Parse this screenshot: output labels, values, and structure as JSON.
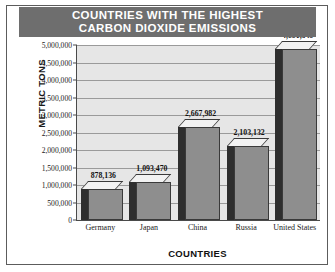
{
  "chart_data": {
    "type": "bar",
    "title": "COUNTRIES WITH THE HIGHEST CARBON DIOXIDE EMISSIONS",
    "title_line1": "COUNTRIES WITH THE HIGHEST",
    "title_line2": "CARBON DIOXIDE EMISSIONS",
    "xlabel": "COUNTRIES",
    "ylabel": "METRIC TONS",
    "categories": [
      "Germany",
      "Japan",
      "China",
      "Russia",
      "United States"
    ],
    "values": [
      878136,
      1093470,
      2667982,
      2103132,
      4881349
    ],
    "value_labels": [
      "878,136",
      "1,093,470",
      "2,667,982",
      "2,103,132",
      "4,881,349"
    ],
    "ylim": [
      0,
      5000000
    ],
    "ytick_values": [
      0,
      500000,
      1000000,
      1500000,
      2000000,
      2500000,
      3000000,
      3500000,
      4000000,
      4500000,
      5000000
    ],
    "ytick_labels": [
      "0",
      "500,000",
      "1,000,000",
      "1,500,000",
      "2,000,000",
      "2,500,000",
      "3,000,000",
      "3,500,000",
      "4,000,000",
      "4,500,000",
      "5,000,000"
    ],
    "grid": true,
    "legend": false,
    "style": "3d-bar",
    "colors": {
      "title_banner": "#6e6e6e",
      "title_text": "#ffffff",
      "plot_background": "#e6e6e6",
      "gridline": "#9a9a9a",
      "bar_face": "#8e8e8e",
      "bar_side": "#2e2e2e",
      "bar_top": "#f2f2f2",
      "bar_outline": "#3a3a3a",
      "axis": "#4a4a4a",
      "frame": "#5c5c5c",
      "text": "#1a1a1a"
    }
  }
}
